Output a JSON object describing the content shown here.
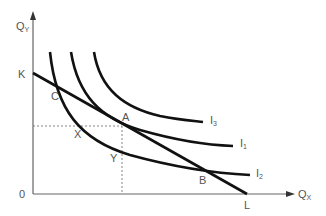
{
  "diagram": {
    "type": "indifference-curve-budget-line",
    "axes": {
      "y_label": "Q",
      "y_label_sub": "Y",
      "x_label": "Q",
      "x_label_sub": "X",
      "origin_label": "0"
    },
    "budget_line": {
      "start_label": "K",
      "end_label": "L"
    },
    "curves": [
      {
        "label": "I",
        "sub": "3"
      },
      {
        "label": "I",
        "sub": "1"
      },
      {
        "label": "I",
        "sub": "2"
      }
    ],
    "points": {
      "a": "A",
      "b": "B",
      "c": "C",
      "x": "X",
      "y": "Y"
    },
    "colors": {
      "line": "#111111",
      "text": "#555555",
      "axis": "#666666"
    }
  }
}
